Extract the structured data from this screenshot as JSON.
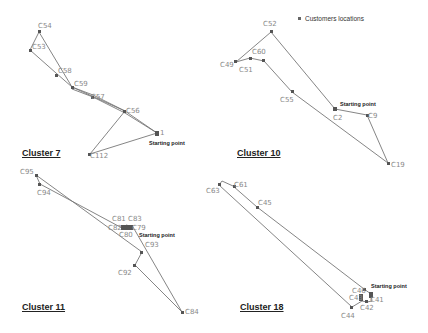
{
  "legend": {
    "label": "Customers locations"
  },
  "start_label": "Starting point",
  "clusters": [
    {
      "title": "Cluster 7",
      "nodes": [
        "C54",
        "C53",
        "C58",
        "C59",
        "C57",
        "C56",
        "C1",
        "C112"
      ],
      "route": [
        "C1",
        "C56",
        "C57",
        "C59",
        "C58",
        "C53",
        "C54",
        "C59",
        "C56",
        "C112",
        "C1"
      ]
    },
    {
      "title": "Cluster 10",
      "nodes": [
        "C52",
        "C60",
        "C49",
        "C51",
        "C55",
        "C2",
        "C9",
        "C19"
      ],
      "route": [
        "C2",
        "C52",
        "C49",
        "C51",
        "C60",
        "C55",
        "C19",
        "C9",
        "C2"
      ]
    },
    {
      "title": "Cluster 11",
      "nodes": [
        "C95",
        "C94",
        "C81",
        "C83",
        "C82",
        "C79",
        "C80",
        "C93",
        "C92",
        "C84"
      ],
      "route": [
        "C79",
        "C84",
        "C92",
        "C93",
        "C95",
        "C94",
        "C80",
        "C82",
        "C81",
        "C83",
        "C79"
      ]
    },
    {
      "title": "Cluster 18",
      "nodes": [
        "C63",
        "C61",
        "C45",
        "C46",
        "C43",
        "C41",
        "C42",
        "C44",
        "C40"
      ],
      "route": [
        "C40",
        "C46",
        "C45",
        "C61",
        "C63",
        "C44",
        "C43",
        "C42",
        "C41",
        "C40"
      ]
    }
  ]
}
